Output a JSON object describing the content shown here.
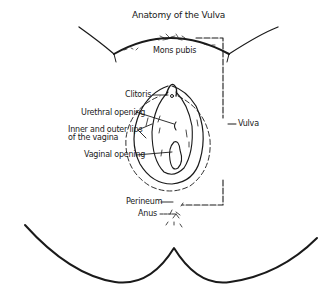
{
  "diagram": {
    "title": "Anatomy of the Vulva",
    "labels": {
      "mons_pubis": "Mons pubis",
      "clitoris": "Clitoris",
      "urethral_opening": "Urethral opening",
      "lips": "Inner and outer lips\nof the vagina",
      "vaginal_opening": "Vaginal opening",
      "vulva": "Vulva",
      "perineum": "Perineum",
      "anus": "Anus"
    },
    "colors": {
      "ink": "#1a1a1a",
      "background": "#ffffff"
    }
  }
}
